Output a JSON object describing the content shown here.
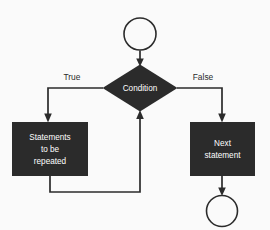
{
  "diagram": {
    "background_color": "#fafafa",
    "shape_fill_color": "#2b2b2b",
    "shape_text_color": "#ffffff",
    "line_color": "#2b2b2b",
    "nodes": {
      "start_terminator": {
        "shape": "circle",
        "label": ""
      },
      "condition": {
        "shape": "diamond",
        "label": "Condition"
      },
      "loop_body": {
        "shape": "rectangle",
        "label_lines": [
          "Statements",
          "to be",
          "repeated"
        ],
        "line1": "Statements",
        "line2": "to be",
        "line3": "repeated"
      },
      "next_statement": {
        "shape": "rectangle",
        "label_lines": [
          "Next",
          "statement"
        ],
        "line1": "Next",
        "line2": "statement"
      },
      "end_terminator": {
        "shape": "circle",
        "label": ""
      }
    },
    "edges": {
      "true_branch": {
        "label": "True"
      },
      "false_branch": {
        "label": "False"
      },
      "loop_back": {
        "label": ""
      },
      "entry": {
        "label": ""
      },
      "exit": {
        "label": ""
      }
    }
  }
}
